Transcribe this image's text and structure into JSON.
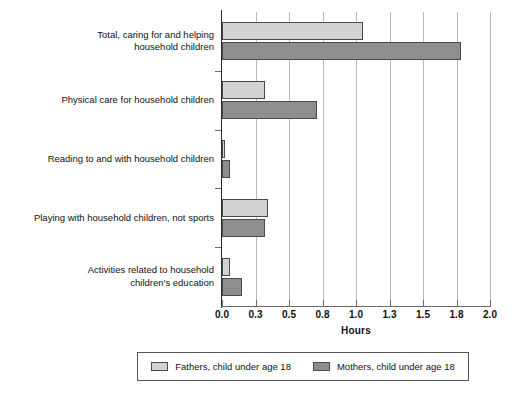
{
  "chart_data": {
    "type": "bar",
    "orientation": "horizontal",
    "title": "",
    "xlabel": "Hours",
    "ylabel": "",
    "xlim": [
      0.0,
      2.0
    ],
    "grid": true,
    "legend_position": "bottom",
    "xticks": [
      "0.0",
      "0.3",
      "0.5",
      "0.8",
      "1.0",
      "1.3",
      "1.5",
      "1.8",
      "2.0"
    ],
    "xtick_values": [
      0.0,
      0.25,
      0.5,
      0.75,
      1.0,
      1.25,
      1.5,
      1.75,
      2.0
    ],
    "categories": [
      "Total, caring for and helping\nhousehold children",
      "Physical care for household children",
      "Reading to and with household children",
      "Playing with household children, not sports",
      "Activities related to household\nchildren's education"
    ],
    "series": [
      {
        "name": "Fathers, child under age 18",
        "color": "#d2d2d2",
        "values": [
          1.05,
          0.32,
          0.02,
          0.34,
          0.06
        ]
      },
      {
        "name": "Mothers, child under age 18",
        "color": "#8e8e8e",
        "values": [
          1.78,
          0.71,
          0.06,
          0.32,
          0.15
        ]
      }
    ]
  },
  "axis": {
    "x_title": "Hours"
  },
  "legend": {
    "items": [
      {
        "label": "Fathers, child under age 18"
      },
      {
        "label": "Mothers, child under age 18"
      }
    ]
  }
}
